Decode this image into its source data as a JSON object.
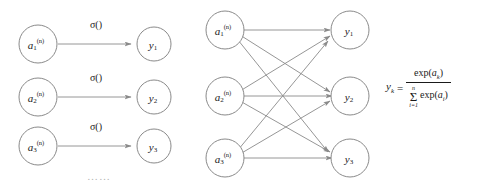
{
  "figure": {
    "background_color": "#ffffff",
    "stroke_color": "#8a8a8a",
    "text_color": "#1a1a1a"
  },
  "left_panel": {
    "name": "elementwise-activation-panel",
    "edge_label": "σ()",
    "ellipsis": "……",
    "rows": [
      {
        "input": {
          "base": "a",
          "subscript": "1",
          "superscript": "(n)"
        },
        "edge_label": "σ()",
        "output": {
          "base": "y",
          "subscript": "1"
        }
      },
      {
        "input": {
          "base": "a",
          "subscript": "2",
          "superscript": "(n)"
        },
        "edge_label": "σ()",
        "output": {
          "base": "y",
          "subscript": "2"
        }
      },
      {
        "input": {
          "base": "a",
          "subscript": "3",
          "superscript": "(n)"
        },
        "edge_label": "σ()",
        "output": {
          "base": "y",
          "subscript": "3"
        }
      }
    ]
  },
  "middle_panel": {
    "name": "fully-connected-softmax-panel",
    "inputs": [
      {
        "base": "a",
        "subscript": "1",
        "superscript": "(n)"
      },
      {
        "base": "a",
        "subscript": "2",
        "superscript": "(n)"
      },
      {
        "base": "a",
        "subscript": "3",
        "superscript": "(n)"
      }
    ],
    "outputs": [
      {
        "base": "y",
        "subscript": "1"
      },
      {
        "base": "y",
        "subscript": "2"
      },
      {
        "base": "y",
        "subscript": "3"
      }
    ],
    "edge_count": 9,
    "fully_connected": true
  },
  "formula": {
    "name": "softmax-equation",
    "lhs_base": "y",
    "lhs_subscript": "k",
    "equals": "=",
    "numerator": {
      "fn": "exp",
      "open": "(",
      "var": "a",
      "var_subscript": "k",
      "close": ")"
    },
    "denominator": {
      "sum_upper": "n",
      "sum_lower": "i=1",
      "sigma": "Σ",
      "fn": "exp",
      "open": "(",
      "var": "a",
      "var_subscript": "i",
      "close": ")"
    }
  }
}
